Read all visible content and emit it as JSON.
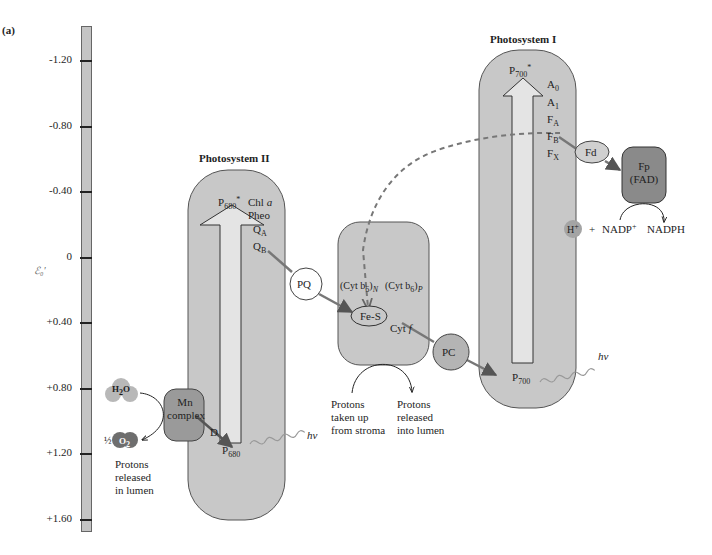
{
  "figure_label": "(a)",
  "axis": {
    "symbol": "ℰ₀′",
    "ticks": [
      "-1.20",
      "-0.80",
      "-0.40",
      "0",
      "+0.40",
      "+0.80",
      "+1.20",
      "+1.60"
    ]
  },
  "photosystem2": {
    "title": "Photosystem II",
    "p680_star": "P",
    "p680_star_sub": "680",
    "p680_star_sup": "*",
    "chl": "Chl ",
    "chl_a": "a",
    "pheo": "Pheo",
    "qa": "Q",
    "qa_sub": "A",
    "qb": "Q",
    "qb_sub": "B",
    "d": "D",
    "p680": "P",
    "p680_sub": "680",
    "hv": "hν",
    "mn_complex_line1": "Mn",
    "mn_complex_line2": "complex",
    "h2o": "H",
    "h2o_sub": "2",
    "h2o_o": "O",
    "half": "½",
    "o2": "O",
    "o2_sub": "2",
    "protons_released": [
      "Protons",
      "released",
      "in lumen"
    ]
  },
  "carriers": {
    "pq": "PQ",
    "pc": "PC",
    "fd": "Fd",
    "fes": "Fe-S"
  },
  "cytochrome": {
    "cyt_b6_n": "(Cyt b",
    "cyt_b6_n_sub": "6",
    "cyt_b6_n_close": ")",
    "cyt_b6_n_side": "N",
    "cyt_b6_p": "(Cyt b",
    "cyt_b6_p_sub": "6",
    "cyt_b6_p_close": ")",
    "cyt_b6_p_side": "P",
    "cyt_f": "Cyt ",
    "cyt_f_ital": "f",
    "protons_taken": [
      "Protons",
      "taken up",
      "from stroma"
    ],
    "protons_into": [
      "Protons",
      "released",
      "into lumen"
    ]
  },
  "photosystem1": {
    "title": "Photosystem I",
    "p700_star": "P",
    "p700_star_sub": "700",
    "p700_star_sup": "*",
    "a0": "A",
    "a0_sub": "0",
    "a1": "A",
    "a1_sub": "1",
    "fa": "F",
    "fa_sub": "A",
    "fb": "F",
    "fb_sub": "B",
    "fx": "F",
    "fx_sub": "X",
    "p700": "P",
    "p700_sub": "700",
    "hv": "hν"
  },
  "fnr": {
    "fp": "Fp",
    "fad": "(FAD)",
    "h_plus": "H",
    "h_plus_sup": "+",
    "plus": "+",
    "nadp": "NADP",
    "nadp_sup": "+",
    "nadph": "NADPH"
  },
  "colors": {
    "complex_fill": "#c8c8c8",
    "complex_stroke": "#555555",
    "dark_fill": "#8a8a8a",
    "arrow_fill": "#e4e4e4",
    "axis_fill": "#c4c4c4"
  }
}
